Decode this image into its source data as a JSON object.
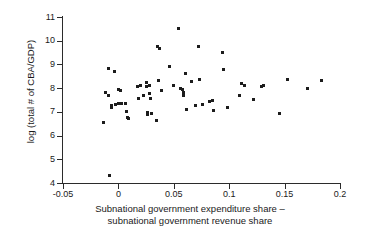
{
  "chart_data": {
    "type": "scatter",
    "title": "",
    "xlabel": "Subnational government expenditure share – subnational government revenue share",
    "xlabel_line1": "Subnational government expenditure share –",
    "xlabel_line2": "subnational government revenue share",
    "ylabel": "log (total # of CBA/GDP)",
    "xlim": [
      -0.05,
      0.2
    ],
    "ylim": [
      4,
      11
    ],
    "xticks": [
      -0.05,
      0,
      0.05,
      0.1,
      0.15,
      0.2
    ],
    "xtick_labels": [
      "-0.05",
      "0",
      "0.05",
      "0.1",
      "0.15",
      "0.2"
    ],
    "yticks": [
      4,
      5,
      6,
      7,
      8,
      9,
      10,
      11
    ],
    "ytick_labels": [
      "4",
      "5",
      "6",
      "7",
      "8",
      "9",
      "10",
      "11"
    ],
    "grid": false,
    "legend": null,
    "marker_color": "#1c1c1c",
    "marker_shape": "square",
    "axis_color": "#2b2b2b",
    "background": "#ffffff",
    "series": [
      {
        "name": "countries",
        "points": [
          [
            -0.013,
            6.57
          ],
          [
            -0.012,
            7.8
          ],
          [
            -0.0085,
            8.82
          ],
          [
            -0.0085,
            7.67
          ],
          [
            -0.008,
            4.31
          ],
          [
            -0.0065,
            7.25
          ],
          [
            -0.006,
            7.2
          ],
          [
            -0.0035,
            8.72
          ],
          [
            -0.003,
            7.3
          ],
          [
            0.0,
            7.95
          ],
          [
            0.0,
            7.36
          ],
          [
            0.002,
            7.92
          ],
          [
            0.003,
            7.35
          ],
          [
            0.006,
            7.35
          ],
          [
            0.007,
            7.02
          ],
          [
            0.0085,
            6.76
          ],
          [
            0.0095,
            6.72
          ],
          [
            0.0175,
            8.08
          ],
          [
            0.018,
            7.58
          ],
          [
            0.02,
            8.13
          ],
          [
            0.0225,
            7.68
          ],
          [
            0.025,
            8.22
          ],
          [
            0.0255,
            8.05
          ],
          [
            0.026,
            6.99
          ],
          [
            0.0265,
            6.88
          ],
          [
            0.028,
            7.76
          ],
          [
            0.0285,
            8.1
          ],
          [
            0.029,
            7.56
          ],
          [
            0.0295,
            6.94
          ],
          [
            0.034,
            6.62
          ],
          [
            0.035,
            9.74
          ],
          [
            0.036,
            8.33
          ],
          [
            0.037,
            9.66
          ],
          [
            0.0385,
            7.88
          ],
          [
            0.0465,
            8.9
          ],
          [
            0.05,
            8.13
          ],
          [
            0.0545,
            10.52
          ],
          [
            0.056,
            8.0
          ],
          [
            0.0575,
            7.95
          ],
          [
            0.0585,
            7.8
          ],
          [
            0.059,
            7.7
          ],
          [
            0.0605,
            8.6
          ],
          [
            0.0615,
            7.12
          ],
          [
            0.066,
            8.27
          ],
          [
            0.07,
            7.25
          ],
          [
            0.072,
            9.77
          ],
          [
            0.073,
            8.38
          ],
          [
            0.076,
            7.32
          ],
          [
            0.0825,
            7.43
          ],
          [
            0.0845,
            7.46
          ],
          [
            0.086,
            7.04
          ],
          [
            0.094,
            9.52
          ],
          [
            0.095,
            8.78
          ],
          [
            0.0985,
            7.17
          ],
          [
            0.109,
            7.67
          ],
          [
            0.111,
            8.18
          ],
          [
            0.1135,
            8.1
          ],
          [
            0.1215,
            7.54
          ],
          [
            0.129,
            8.05
          ],
          [
            0.131,
            8.1
          ],
          [
            0.1455,
            6.93
          ],
          [
            0.1525,
            8.38
          ],
          [
            0.1705,
            7.98
          ],
          [
            0.183,
            8.33
          ]
        ]
      }
    ]
  }
}
